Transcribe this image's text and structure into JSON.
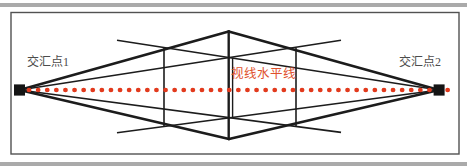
{
  "figure": {
    "left_vanishing_point_label": "交汇点1",
    "right_vanishing_point_label": "交汇点2",
    "horizon_line_label": "视线水平线"
  },
  "icons": {
    "left_marker": "vanishing-point-square",
    "right_marker": "vanishing-point-square",
    "horizon": "red-dotted-line"
  },
  "colors": {
    "accent_red": "#e23a1d",
    "horizon_text_red": "#e0502c",
    "line_ink": "#1c1c1c",
    "marker_black": "#141414",
    "label_gray": "#4c4c4c",
    "frame_gray": "#525252",
    "strip_gray": "#aaaaaa",
    "background": "#ffffff"
  }
}
